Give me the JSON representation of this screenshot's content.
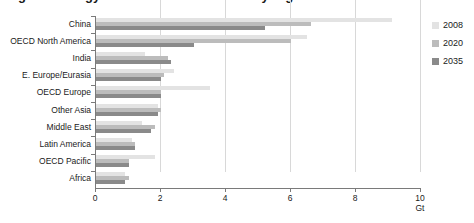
{
  "title": "Figure: Energy-related CO2 emissions by region",
  "chart_data": {
    "type": "bar",
    "orientation": "horizontal",
    "title": "",
    "xlabel": "Gt",
    "ylabel": "",
    "xlim": [
      0,
      10
    ],
    "xticks": [
      0,
      2,
      4,
      6,
      8,
      10
    ],
    "xtick_labels": [
      "0",
      "2",
      "4",
      "6",
      "8",
      "10"
    ],
    "grid": "vertical",
    "legend_position": "right",
    "categories": [
      "China",
      "OECD North America",
      "India",
      "E. Europe/Eurasia",
      "OECD Europe",
      "Other Asia",
      "Middle East",
      "Latin America",
      "OECD Pacific",
      "Africa"
    ],
    "series": [
      {
        "name": "2008",
        "color": "#e3e3e3",
        "values": [
          9.1,
          6.5,
          1.5,
          2.4,
          3.5,
          1.9,
          1.4,
          1.1,
          1.8,
          0.9
        ]
      },
      {
        "name": "2020",
        "color": "#bcbcbc",
        "values": [
          6.6,
          6.0,
          2.2,
          2.1,
          2.0,
          2.0,
          1.8,
          1.2,
          1.0,
          1.0
        ]
      },
      {
        "name": "2035",
        "color": "#8a8a8a",
        "values": [
          5.2,
          3.0,
          2.3,
          2.0,
          2.0,
          1.9,
          1.7,
          1.2,
          1.0,
          0.9
        ]
      }
    ]
  },
  "legend": {
    "items": [
      {
        "label": "2008",
        "color": "#e3e3e3"
      },
      {
        "label": "2020",
        "color": "#bcbcbc"
      },
      {
        "label": "2035",
        "color": "#8a8a8a"
      }
    ]
  },
  "axis": {
    "unit_label": "Gt"
  }
}
